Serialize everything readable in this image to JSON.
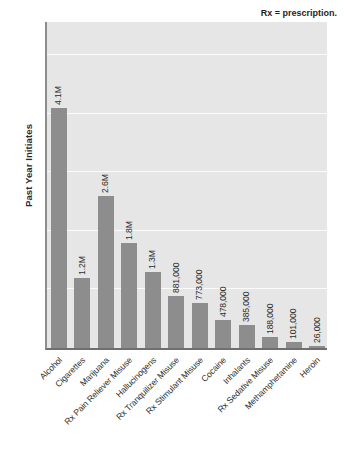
{
  "chart_data": {
    "type": "bar",
    "title": "",
    "subtitle": "",
    "xlabel": "",
    "ylabel": "Past Year Initiates",
    "ylim": [
      0,
      5.6
    ],
    "ytick_values": [
      0,
      1,
      2,
      3,
      4,
      5
    ],
    "ytick_labels": [
      "0",
      "1",
      "2",
      "3",
      "4",
      "5"
    ],
    "grid": true,
    "legend": "none",
    "annotations": [
      "Rx = prescription."
    ],
    "units": "millions",
    "categories": [
      "Alcohol",
      "Cigarettes",
      "Marijuana",
      "Rx Pain Reliever Misuse",
      "Hallucinogens",
      "Rx Tranquilizer Misuse",
      "Rx Stimulant Misuse",
      "Cocaine",
      "Inhalants",
      "Rx Sedative Misuse",
      "Methamphetamine",
      "Heroin"
    ],
    "values": [
      4.1,
      1.2,
      2.6,
      1.8,
      1.3,
      0.881,
      0.773,
      0.478,
      0.385,
      0.188,
      0.101,
      0.026
    ],
    "data_labels": [
      "4.1M",
      "1.2M",
      "2.6M",
      "1.8M",
      "1.3M",
      "881,000",
      "773,000",
      "478,000",
      "385,000",
      "188,000",
      "101,000",
      "26,000"
    ],
    "colors": {
      "bar": "#8d8d8d",
      "plot_background": "#e6e6e6",
      "gridline": "#fbfbfb",
      "axis": "#6f6f6f",
      "text": "#2f2f2f",
      "page_background": "#ffffff"
    }
  }
}
